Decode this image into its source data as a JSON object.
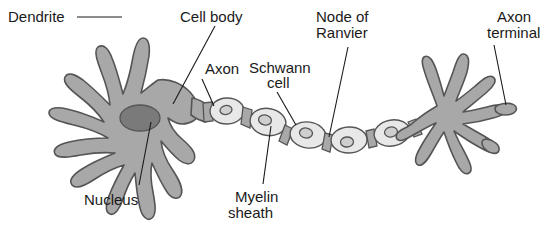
{
  "figure": {
    "background_color": "#ffffff",
    "cell_fill_color": "#a8a8a8",
    "myelin_fill_color": "#e3e3e3",
    "nucleus_fill_color": "#7a7a7a",
    "outline_color": "#555555",
    "text_color": "#1a1a1a"
  },
  "labels": {
    "dendrite": "Dendrite",
    "cell_body": "Cell body",
    "axon": "Axon",
    "schwann_cell_line1": "Schwann",
    "schwann_cell_line2": "cell",
    "node_of_ranvier_line1": "Node of",
    "node_of_ranvier_line2": "Ranvier",
    "axon_terminal_line1": "Axon",
    "axon_terminal_line2": "terminal",
    "nucleus": "Nucleus",
    "myelin_sheath_line1": "Myelin",
    "myelin_sheath_line2": "sheath"
  },
  "parts": [
    {
      "id": "dendrite",
      "label": "Dendrite",
      "count": 1
    },
    {
      "id": "cell-body",
      "label": "Cell body",
      "count": 1
    },
    {
      "id": "nucleus",
      "label": "Nucleus",
      "count": 1
    },
    {
      "id": "axon",
      "label": "Axon",
      "count": 1
    },
    {
      "id": "schwann-cell",
      "label": "Schwann cell",
      "count": 6
    },
    {
      "id": "myelin-sheath",
      "label": "Myelin sheath",
      "count": 6
    },
    {
      "id": "node-of-ranvier",
      "label": "Node of Ranvier",
      "count": 5
    },
    {
      "id": "axon-terminal",
      "label": "Axon terminal",
      "count": 1
    }
  ]
}
